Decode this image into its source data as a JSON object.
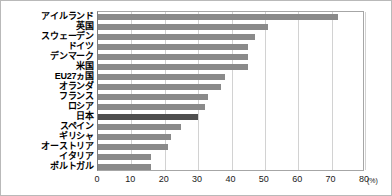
{
  "chart_data": {
    "type": "bar",
    "orientation": "horizontal",
    "title": "",
    "subtitle": "",
    "xlabel": "(%)",
    "ylabel": "",
    "xlim": [
      0,
      80
    ],
    "xticks": [
      0,
      10,
      20,
      30,
      40,
      50,
      60,
      70,
      80
    ],
    "xtick_labels": [
      "0",
      "10",
      "20",
      "30",
      "40",
      "50",
      "60",
      "70",
      "80"
    ],
    "unit_label": "(%)",
    "grid": true,
    "grid_axis": "x",
    "legend": null,
    "categories": [
      "アイルランド",
      "英国",
      "スウェーデン",
      "ドイツ",
      "デンマーク",
      "米国",
      "EU27ヵ国",
      "オランダ",
      "フランス",
      "ロシア",
      "日本",
      "スペイン",
      "ギリシャ",
      "オーストリア",
      "イタリア",
      "ポルトガル"
    ],
    "values": [
      72,
      51,
      47,
      45,
      45,
      45,
      38,
      37,
      33,
      32,
      30,
      25,
      22,
      21,
      16,
      16
    ],
    "highlight_index": 10,
    "bar_color": "#8a8a8a",
    "highlight_color": "#4f4f4f",
    "gridline_color": "#d2d2d2",
    "axis_color": "#7d7d7d",
    "background_color": "#ffffff"
  }
}
